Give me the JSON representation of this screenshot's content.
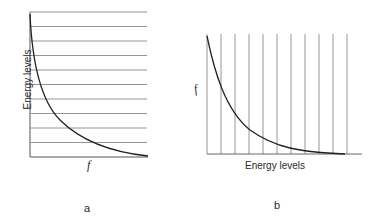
{
  "panels": [
    {
      "id": "a",
      "caption": "a",
      "axis_label": "Energy levels",
      "function_label": "f",
      "orientation": "energy levels on vertical axis, f on horizontal axis",
      "level_count": 10
    },
    {
      "id": "b",
      "caption": "b",
      "axis_label": "Energy levels",
      "function_label": "f",
      "orientation": "energy levels on horizontal axis, f on vertical axis",
      "level_count": 10
    }
  ],
  "colors": {
    "grid": "#8a8a8a",
    "curve": "#222222",
    "text": "#2a2a2a"
  }
}
